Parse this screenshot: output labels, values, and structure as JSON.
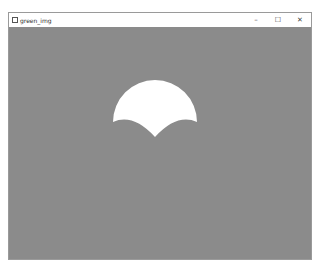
{
  "window": {
    "title": "green_img",
    "controls": {
      "minimize": "–",
      "maximize": "☐",
      "close": "✕"
    }
  },
  "canvas": {
    "background_color": "#8b8b8b",
    "shape": {
      "name": "scalloped-semicircle",
      "fill": "#ffffff"
    }
  }
}
